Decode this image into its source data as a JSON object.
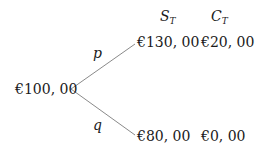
{
  "headers": {
    "stock": {
      "symbol": "S",
      "subscript": "T"
    },
    "call": {
      "symbol": "C",
      "subscript": "T"
    }
  },
  "root": {
    "value": "€100, 00"
  },
  "branches": [
    {
      "probability": "p",
      "stock_value": "€130, 00",
      "call_value": "€20, 00"
    },
    {
      "probability": "q",
      "stock_value": "€80, 00",
      "call_value": "€0, 00"
    }
  ],
  "colors": {
    "line": "#8a8a8a",
    "text": "#1a1a1a"
  }
}
